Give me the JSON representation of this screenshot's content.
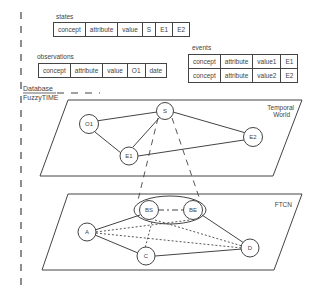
{
  "states": {
    "title": "states",
    "cells": [
      "concept",
      "attribute",
      "value",
      "S",
      "E1",
      "E2"
    ]
  },
  "observations": {
    "title": "observations",
    "cells": [
      "concept",
      "attribute",
      "value",
      "O1",
      "date"
    ]
  },
  "events": {
    "title": "events",
    "rows": [
      [
        "concept",
        "attribute",
        "value1",
        "E1"
      ],
      [
        "concept",
        "attribute",
        "value2",
        "E2"
      ]
    ]
  },
  "labels": {
    "database": "Database",
    "fuzzytime": "FuzzyTIME",
    "temporal_world_1": "Temporal",
    "temporal_world_2": "World",
    "ftcn": "FTCN"
  },
  "temporal_world_nodes": {
    "S": "S",
    "O1": "O1",
    "E1": "E1",
    "E2": "E2"
  },
  "ftcn_nodes": {
    "BS": "BS",
    "BE": "BE",
    "A": "A",
    "C": "C",
    "D": "D"
  }
}
